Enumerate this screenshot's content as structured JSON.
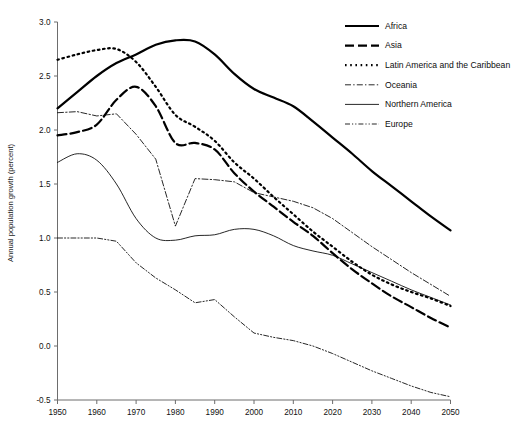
{
  "figure": {
    "clipped_header": "",
    "background": "#ffffff",
    "ink_color": "#000000",
    "axis_color": "#6d6d6d"
  },
  "chart_data": {
    "type": "line",
    "title": "",
    "xlabel": "",
    "ylabel": "Annual population growth   (percent)",
    "xlim": [
      1950,
      2050
    ],
    "ylim": [
      -0.5,
      3.0
    ],
    "xticks": [
      "1950",
      "1960",
      "1970",
      "1980",
      "1990",
      "2000",
      "2010",
      "2020",
      "2030",
      "2040",
      "2050"
    ],
    "yticks": [
      "3.0",
      "2.5",
      "2.0",
      "1.5",
      "1.0",
      "0.5",
      "0.0",
      "-0.5"
    ],
    "grid": false,
    "legend_position": "top-right",
    "x": [
      1950,
      1955,
      1960,
      1965,
      1970,
      1975,
      1980,
      1985,
      1990,
      1995,
      2000,
      2005,
      2010,
      2015,
      2020,
      2025,
      2030,
      2035,
      2040,
      2045,
      2050
    ],
    "series": [
      {
        "name": "Africa",
        "style": "solid-thick",
        "stroke_width": 2.2,
        "dash": "none",
        "values": [
          2.2,
          2.35,
          2.5,
          2.62,
          2.7,
          2.79,
          2.83,
          2.82,
          2.7,
          2.52,
          2.38,
          2.3,
          2.22,
          2.08,
          1.93,
          1.78,
          1.62,
          1.48,
          1.34,
          1.2,
          1.07
        ]
      },
      {
        "name": "Asia",
        "style": "dashed-thick",
        "stroke_width": 2.2,
        "dash": "9,4",
        "values": [
          1.95,
          1.98,
          2.05,
          2.28,
          2.4,
          2.22,
          1.88,
          1.88,
          1.82,
          1.6,
          1.43,
          1.29,
          1.15,
          1.02,
          0.86,
          0.71,
          0.58,
          0.46,
          0.36,
          0.26,
          0.17
        ]
      },
      {
        "name": "Latin America and the Caribbean",
        "style": "dotted-thick",
        "stroke_width": 2.2,
        "dash": "1.6,3.6",
        "values": [
          2.65,
          2.7,
          2.74,
          2.75,
          2.63,
          2.4,
          2.14,
          2.03,
          1.9,
          1.7,
          1.55,
          1.38,
          1.22,
          1.06,
          0.92,
          0.78,
          0.66,
          0.57,
          0.5,
          0.44,
          0.37
        ]
      },
      {
        "name": "Oceania",
        "style": "dash-dot-thin",
        "stroke_width": 0.85,
        "dash": "6,2.2,1.4,2.2",
        "values": [
          2.16,
          2.17,
          2.13,
          2.15,
          1.96,
          1.73,
          1.11,
          1.55,
          1.54,
          1.52,
          1.42,
          1.38,
          1.34,
          1.28,
          1.18,
          1.05,
          0.92,
          0.8,
          0.68,
          0.57,
          0.46
        ]
      },
      {
        "name": "Northern America",
        "style": "solid-thin",
        "stroke_width": 0.85,
        "values": [
          1.7,
          1.78,
          1.72,
          1.5,
          1.18,
          1.0,
          0.98,
          1.02,
          1.03,
          1.08,
          1.08,
          1.02,
          0.93,
          0.88,
          0.84,
          0.76,
          0.68,
          0.6,
          0.52,
          0.45,
          0.38
        ]
      },
      {
        "name": "Europe",
        "style": "dash-dot-dot-thin",
        "stroke_width": 0.85,
        "dash": "5,2,1.2,2,1.2,2",
        "values": [
          1.0,
          1.0,
          1.0,
          0.97,
          0.77,
          0.63,
          0.52,
          0.4,
          0.43,
          0.27,
          0.12,
          0.08,
          0.05,
          0.0,
          -0.07,
          -0.15,
          -0.23,
          -0.3,
          -0.37,
          -0.43,
          -0.47
        ]
      }
    ]
  },
  "legend": {
    "entries": [
      {
        "label": "Africa"
      },
      {
        "label": "Asia"
      },
      {
        "label": "Latin America and the Caribbean"
      },
      {
        "label": "Oceania"
      },
      {
        "label": "Northern America"
      },
      {
        "label": "Europe"
      }
    ]
  }
}
